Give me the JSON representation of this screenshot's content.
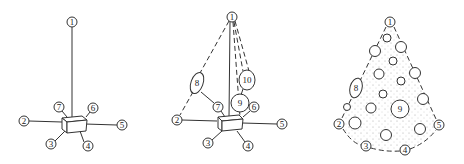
{
  "figure": {
    "panels": [
      {
        "id": "a",
        "description": "Pendant/star graph: hub box with 7 numbered nodes",
        "nodes": [
          {
            "label": "1",
            "x": 72,
            "y": 22
          },
          {
            "label": "2",
            "x": 24,
            "y": 121
          },
          {
            "label": "3",
            "x": 51,
            "y": 144
          },
          {
            "label": "4",
            "x": 88,
            "y": 146
          },
          {
            "label": "5",
            "x": 122,
            "y": 125
          },
          {
            "label": "6",
            "x": 93,
            "y": 108
          },
          {
            "label": "7",
            "x": 59,
            "y": 107
          }
        ]
      },
      {
        "id": "b",
        "description": "Star graph with additional nodes 8, 9, 10 connected by dashed lines",
        "nodes": [
          {
            "label": "1",
            "x": 232,
            "y": 17
          },
          {
            "label": "2",
            "x": 177,
            "y": 120
          },
          {
            "label": "3",
            "x": 208,
            "y": 143
          },
          {
            "label": "4",
            "x": 248,
            "y": 146
          },
          {
            "label": "5",
            "x": 282,
            "y": 124
          },
          {
            "label": "6",
            "x": 254,
            "y": 107
          },
          {
            "label": "7",
            "x": 218,
            "y": 107
          },
          {
            "label": "8",
            "x": 197,
            "y": 83
          },
          {
            "label": "9",
            "x": 240,
            "y": 103
          },
          {
            "label": "10",
            "x": 247,
            "y": 80
          }
        ]
      },
      {
        "id": "c",
        "description": "Cone-shaped dotted region bounded by dashed outline containing many circles",
        "nodes": [
          {
            "label": "1",
            "x": 390,
            "y": 22
          },
          {
            "label": "2",
            "x": 339,
            "y": 124
          },
          {
            "label": "3",
            "x": 366,
            "y": 146
          },
          {
            "label": "4",
            "x": 405,
            "y": 150
          },
          {
            "label": "5",
            "x": 439,
            "y": 125
          },
          {
            "label": "8",
            "x": 356,
            "y": 88
          },
          {
            "label": "9",
            "x": 400,
            "y": 109
          }
        ]
      }
    ]
  }
}
